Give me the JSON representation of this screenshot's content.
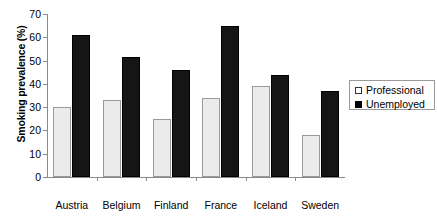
{
  "chart_data": {
    "type": "bar",
    "title": "",
    "xlabel": "",
    "ylabel": "Smoking prevalence (%)",
    "ylim": [
      0,
      70
    ],
    "yticks": [
      0,
      10,
      20,
      30,
      40,
      50,
      60,
      70
    ],
    "grid": false,
    "legend_position": "right",
    "categories": [
      "Austria",
      "Belgium",
      "Finland",
      "France",
      "Iceland",
      "Sweden"
    ],
    "series": [
      {
        "name": "Professional",
        "color": "#ebebeb",
        "values": [
          30,
          33,
          25,
          34,
          39,
          18
        ]
      },
      {
        "name": "Unemployed",
        "color": "#151515",
        "values": [
          61,
          51.5,
          46,
          65,
          44,
          37
        ]
      }
    ]
  },
  "legend": {
    "entries": [
      {
        "label": "Professional",
        "swatch": "professional"
      },
      {
        "label": "Unemployed",
        "swatch": "unemployed"
      }
    ]
  }
}
